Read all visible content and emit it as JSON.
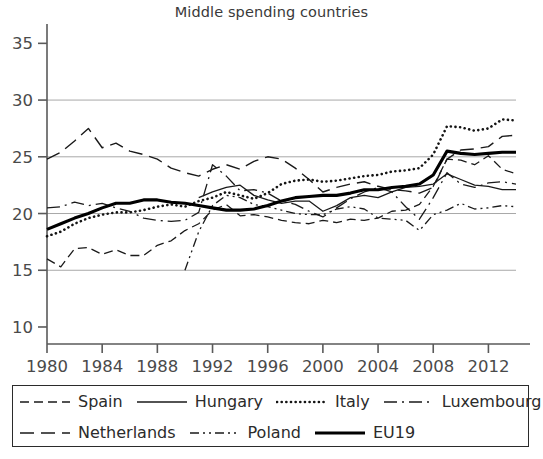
{
  "chart_data": {
    "type": "line",
    "title": "Middle spending countries",
    "xlabel": "",
    "ylabel": "",
    "xlim": [
      1980,
      2014
    ],
    "ylim": [
      8.5,
      36
    ],
    "grid": true,
    "grid_values": [
      15,
      20,
      25,
      30
    ],
    "legend_position": "below",
    "yticks": [
      "10",
      "15",
      "20",
      "25",
      "30",
      "35"
    ],
    "ytick_values": [
      10,
      15,
      20,
      25,
      30,
      35
    ],
    "xticks": [
      "1980",
      "1984",
      "1988",
      "1992",
      "1996",
      "2000",
      "2004",
      "2008",
      "2012"
    ],
    "xtick_values": [
      1980,
      1984,
      1988,
      1992,
      1996,
      2000,
      2004,
      2008,
      2012
    ],
    "x": [
      1980,
      1981,
      1982,
      1983,
      1984,
      1985,
      1986,
      1987,
      1988,
      1989,
      1990,
      1991,
      1992,
      1993,
      1994,
      1995,
      1996,
      1997,
      1998,
      1999,
      2000,
      2001,
      2002,
      2003,
      2004,
      2005,
      2006,
      2007,
      2008,
      2009,
      2010,
      2011,
      2012,
      2013,
      2014
    ],
    "series": [
      {
        "name": "Spain",
        "style": "dashed",
        "width": 1.3,
        "color": "#1a1a1a",
        "values": [
          16.0,
          15.3,
          16.9,
          17.0,
          16.4,
          16.8,
          16.3,
          16.3,
          17.2,
          17.6,
          18.5,
          19.1,
          20.3,
          20.8,
          19.8,
          19.9,
          19.7,
          19.4,
          19.2,
          19.1,
          19.4,
          19.2,
          19.5,
          19.4,
          19.6,
          20.2,
          20.3,
          20.8,
          22.4,
          24.8,
          24.7,
          24.3,
          25.1,
          23.9,
          23.5
        ]
      },
      {
        "name": "Hungary",
        "style": "solid-thin",
        "width": 1.3,
        "color": "#1a1a1a",
        "values": [
          null,
          null,
          null,
          null,
          null,
          null,
          null,
          null,
          null,
          null,
          null,
          21.4,
          21.9,
          22.3,
          22.5,
          21.6,
          21.2,
          20.9,
          21.1,
          21.1,
          20.2,
          20.7,
          21.4,
          21.6,
          21.4,
          21.9,
          22.3,
          22.4,
          22.6,
          23.5,
          23.0,
          22.5,
          22.4,
          22.1,
          22.1
        ]
      },
      {
        "name": "Italy",
        "style": "dotted",
        "width": 2.6,
        "color": "#141414",
        "values": [
          18.0,
          18.4,
          19.1,
          19.6,
          19.9,
          20.1,
          20.1,
          20.3,
          20.6,
          20.8,
          20.6,
          21.1,
          21.4,
          21.9,
          21.6,
          21.3,
          21.8,
          22.6,
          22.9,
          23.0,
          22.8,
          22.9,
          23.1,
          23.3,
          23.4,
          23.7,
          23.8,
          24.0,
          25.2,
          27.7,
          27.6,
          27.3,
          27.5,
          28.3,
          28.2
        ]
      },
      {
        "name": "Luxembourg",
        "style": "dash-dot",
        "width": 1.3,
        "color": "#1a1a1a",
        "values": [
          20.5,
          20.6,
          21.0,
          20.7,
          20.9,
          20.5,
          20.2,
          19.6,
          19.4,
          19.3,
          19.4,
          20.1,
          24.3,
          23.3,
          22.0,
          22.1,
          21.8,
          21.1,
          20.8,
          20.2,
          19.7,
          20.5,
          21.3,
          21.9,
          22.3,
          21.9,
          20.6,
          19.5,
          21.4,
          23.6,
          22.6,
          22.3,
          22.7,
          22.8,
          22.6
        ]
      },
      {
        "name": "Netherlands",
        "style": "long-dash",
        "width": 1.4,
        "color": "#1a1a1a",
        "values": [
          24.8,
          25.4,
          26.4,
          27.5,
          25.8,
          26.2,
          25.5,
          25.2,
          24.8,
          24.0,
          23.6,
          23.3,
          23.9,
          24.3,
          23.9,
          24.6,
          25.0,
          24.8,
          24.0,
          23.0,
          21.9,
          22.3,
          22.6,
          22.8,
          22.4,
          22.1,
          22.0,
          21.8,
          22.3,
          24.8,
          25.6,
          25.7,
          25.9,
          26.8,
          26.9
        ]
      },
      {
        "name": "Poland",
        "style": "dash-dot-dot",
        "width": 1.3,
        "color": "#1a1a1a",
        "values": [
          null,
          null,
          null,
          null,
          null,
          null,
          null,
          null,
          null,
          null,
          15.0,
          18.4,
          20.7,
          21.6,
          21.4,
          20.8,
          20.6,
          20.3,
          20.0,
          19.9,
          19.9,
          20.4,
          20.6,
          20.4,
          19.6,
          19.5,
          19.4,
          18.5,
          19.9,
          20.3,
          20.9,
          20.4,
          20.5,
          20.7,
          20.6
        ]
      },
      {
        "name": "EU19",
        "style": "solid-thick",
        "width": 3.1,
        "color": "#000000",
        "values": [
          18.6,
          19.1,
          19.6,
          20.0,
          20.5,
          20.9,
          20.9,
          21.2,
          21.2,
          21.0,
          20.9,
          20.7,
          20.5,
          20.3,
          20.3,
          20.4,
          20.7,
          21.1,
          21.4,
          21.5,
          21.6,
          21.6,
          21.8,
          22.1,
          22.1,
          22.3,
          22.4,
          22.6,
          23.4,
          25.5,
          25.3,
          25.2,
          25.3,
          25.4,
          25.4
        ]
      }
    ]
  },
  "legend": {
    "rows": [
      [
        {
          "label": "Spain",
          "style": "dashed"
        },
        {
          "label": "Hungary",
          "style": "solid-thin"
        },
        {
          "label": "Italy",
          "style": "dotted"
        },
        {
          "label": "Luxembourg",
          "style": "dash-dot"
        }
      ],
      [
        {
          "label": "Netherlands",
          "style": "long-dash"
        },
        {
          "label": "Poland",
          "style": "dash-dot-dot"
        },
        {
          "label": "EU19",
          "style": "solid-thick"
        }
      ]
    ]
  },
  "colors": {
    "ink": "#231f20",
    "grid": "#a8a8a8",
    "axis": "#5a5a5a",
    "background": "#ffffff"
  }
}
